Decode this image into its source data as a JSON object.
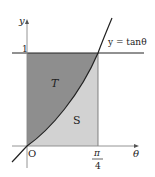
{
  "diagram": {
    "axes": {
      "x_label": "θ",
      "y_label": "y",
      "origin_label": "O"
    },
    "ticks": {
      "y_one": "1",
      "x_pi_num": "π",
      "x_pi_den": "4"
    },
    "curve_label": "y = tanθ",
    "regions": {
      "upper": "T",
      "lower": "S"
    },
    "colors": {
      "region_T": "#8e8e8e",
      "region_S": "#d2d2d2",
      "lines": "#222222"
    }
  }
}
